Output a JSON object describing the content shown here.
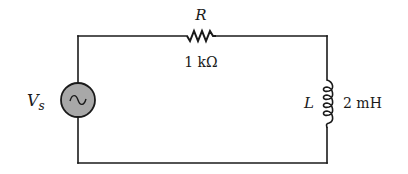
{
  "diagram": {
    "type": "RL series circuit",
    "source": {
      "symbol": "V",
      "subscript": "s",
      "kind": "ac-voltage-source",
      "fill": "#a8a8a8"
    },
    "resistor": {
      "symbol": "R",
      "value": "1 kΩ"
    },
    "inductor": {
      "symbol": "L",
      "value": "2 mH"
    },
    "colors": {
      "wire": "#1a1a1a",
      "background": "#ffffff"
    }
  }
}
